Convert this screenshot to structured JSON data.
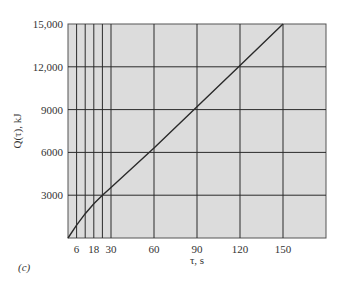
{
  "chart_data": {
    "type": "line",
    "title": "",
    "panel_label": "(c)",
    "xlabel": "τ, s",
    "ylabel": "Q(τ), kJ",
    "xlim": [
      0,
      180
    ],
    "ylim": [
      0,
      15000
    ],
    "grid": true,
    "x_gridlines": [
      6,
      12,
      18,
      24,
      30,
      60,
      90,
      120,
      150
    ],
    "x_ticks": [
      6,
      18,
      30,
      60,
      90,
      120,
      150
    ],
    "x_tick_labels": [
      "6",
      "18",
      "30",
      "60",
      "90",
      "120",
      "150"
    ],
    "y_ticks": [
      3000,
      6000,
      9000,
      12000,
      15000
    ],
    "y_tick_labels": [
      "3000",
      "6000",
      "9000",
      "12,000",
      "15,000"
    ],
    "series": [
      {
        "name": "Q(τ)",
        "x": [
          0,
          6,
          12,
          18,
          24,
          30,
          60,
          90,
          120,
          150
        ],
        "y": [
          0,
          900,
          1700,
          2400,
          3000,
          3550,
          6300,
          9200,
          12100,
          15000
        ]
      }
    ],
    "colors": {
      "plot_bg": "#dcdcdc",
      "grid": "#2a2a2a",
      "line": "#2a2a2a"
    }
  }
}
